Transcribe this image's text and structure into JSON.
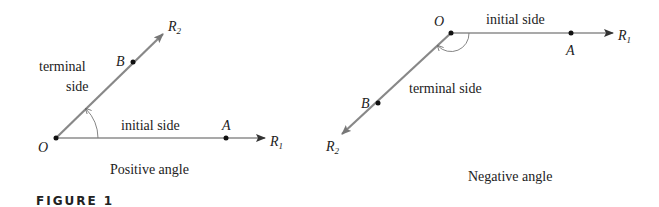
{
  "figure_label": "FIGURE 1",
  "positive": {
    "caption": "Positive angle",
    "origin_label": "O",
    "point_a": "A",
    "point_b": "B",
    "ray1": {
      "letter": "R",
      "sub": "1"
    },
    "ray2": {
      "letter": "R",
      "sub": "2"
    },
    "initial_side": "initial side",
    "terminal_side_line1": "terminal",
    "terminal_side_line2": "side"
  },
  "negative": {
    "caption": "Negative angle",
    "origin_label": "O",
    "point_a": "A",
    "point_b": "B",
    "ray1": {
      "letter": "R",
      "sub": "1"
    },
    "ray2": {
      "letter": "R",
      "sub": "2"
    },
    "initial_side": "initial side",
    "terminal_side": "terminal side"
  },
  "colors": {
    "terminal_ray": "#777777",
    "initial_ray": "#555555",
    "text": "#222222"
  }
}
